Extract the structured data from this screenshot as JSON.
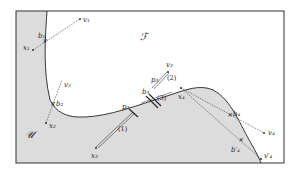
{
  "diagram": {
    "regions": {
      "free": {
        "label": "ℱ",
        "name": "F"
      },
      "unsafe": {
        "label": "𝒰",
        "name": "U"
      }
    },
    "colors": {
      "unsafe_fill": "#dcdcdc",
      "boundary": "#222222",
      "frame": "#333333",
      "background": "#ffffff"
    },
    "cases": [
      {
        "x": "x₁",
        "b": "b₁",
        "v": "v₁"
      },
      {
        "x": "x₂",
        "b": "b₂",
        "v": "v₂"
      },
      {
        "x": "x₃",
        "p": "p₃",
        "step": "(1)"
      },
      {
        "p": "p₃",
        "v": "v₃",
        "step": "(2)"
      },
      {
        "b": "b₃",
        "step": "(3)"
      },
      {
        "x": "x₄",
        "b": "b₄",
        "v": "v₄"
      },
      {
        "b": "b′₄",
        "v": "v′₄"
      }
    ],
    "labels": {
      "x1": "x₁",
      "b1": "b₁",
      "v1": "v₁",
      "x2": "x₂",
      "b2": "b₂",
      "v2": "v₂",
      "x3": "x₃",
      "p3a": "p₃",
      "p3b": "p₃",
      "b3": "b₃",
      "v3": "v₃",
      "x4": "x₄",
      "b4": "b₄",
      "v4": "v₄",
      "b4p": "b′₄",
      "v4p": "v′₄",
      "step1": "(1)",
      "step2": "(2)",
      "step3": "(3)"
    }
  }
}
